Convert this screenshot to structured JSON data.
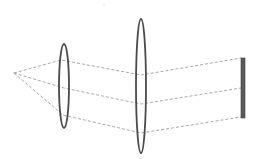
{
  "diagram": {
    "type": "optical-ray-diagram",
    "colors": {
      "background": "#ffffff",
      "ray": "#a8a8a8",
      "lens": "#4a4a4a",
      "screen": "#5a5a5a"
    },
    "elements": {
      "source": {
        "x": 14,
        "y": 73
      },
      "lens_1": {
        "cx": 64,
        "cy": 86,
        "rx": 5,
        "ry": 42
      },
      "lens_2": {
        "cx": 141,
        "cy": 86,
        "rx": 5,
        "ry": 67
      },
      "screen": {
        "x": 241,
        "y": 58,
        "width": 4,
        "height": 60
      }
    },
    "rays": [
      {
        "name": "upper-ray",
        "points": [
          [
            14,
            73
          ],
          [
            61,
            60
          ],
          [
            141,
            75
          ],
          [
            241,
            58
          ]
        ]
      },
      {
        "name": "middle-ray",
        "points": [
          [
            14,
            73
          ],
          [
            64,
            88
          ],
          [
            141,
            104
          ],
          [
            241,
            88
          ]
        ]
      },
      {
        "name": "lower-ray",
        "points": [
          [
            14,
            73
          ],
          [
            63,
            115
          ],
          [
            141,
            133
          ],
          [
            241,
            117
          ]
        ]
      }
    ]
  }
}
